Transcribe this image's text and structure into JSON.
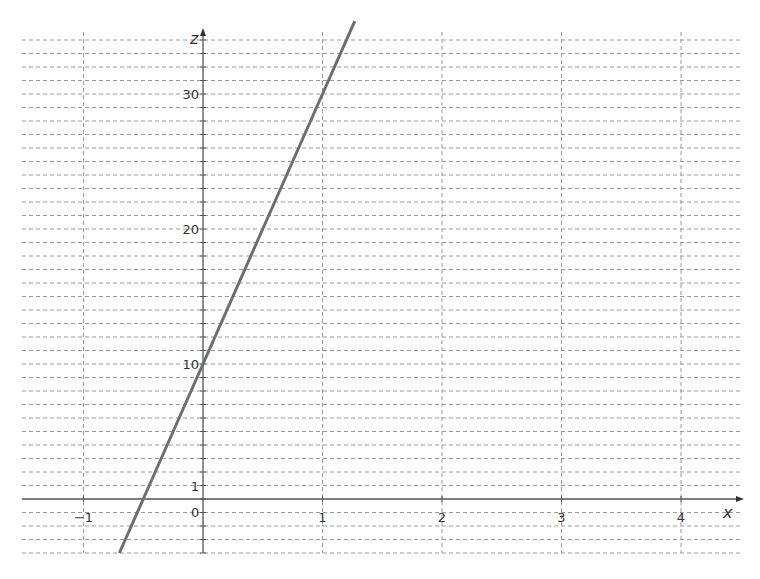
{
  "chart_data": {
    "type": "line",
    "title": "",
    "xlabel": "x",
    "ylabel": "z",
    "xlim": [
      -1.5,
      4.5
    ],
    "ylim": [
      -4,
      35
    ],
    "grid": true,
    "grid_style": "dashed",
    "x_ticks": [
      -1,
      1,
      2,
      3,
      4
    ],
    "x_tick_labels": [
      "−1",
      "1",
      "2",
      "3",
      "4"
    ],
    "y_ticks": [
      1,
      10,
      20,
      30
    ],
    "y_tick_labels": [
      "1",
      "10",
      "20",
      "30"
    ],
    "origin_label": "0",
    "series": [
      {
        "name": "z = 20x + 10",
        "equation": "z = 20x + 10",
        "x": [
          -0.7,
          -0.5,
          0,
          0.5,
          1,
          1.27
        ],
        "values": [
          -4,
          0,
          10,
          20,
          30,
          35.4
        ],
        "color": "#6e6e6e"
      }
    ],
    "legend": null
  },
  "colors": {
    "axis": "#555555",
    "grid": "#9a9a9a",
    "line": "#6e6e6e",
    "text": "#333333"
  }
}
